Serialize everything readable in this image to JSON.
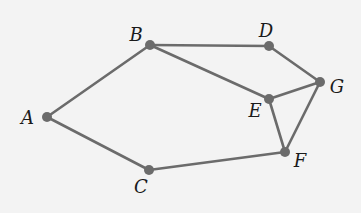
{
  "diagram": {
    "type": "graph",
    "background": "#f3f3f3",
    "edge_color": "#6b6b6b",
    "node_color": "#6b6b6b",
    "nodes": [
      {
        "id": "A",
        "label": "A",
        "x": 47,
        "y": 117,
        "lx": 34,
        "ly": 124,
        "anchor": "end"
      },
      {
        "id": "B",
        "label": "B",
        "x": 150,
        "y": 45,
        "lx": 136,
        "ly": 41,
        "anchor": "middle"
      },
      {
        "id": "C",
        "label": "C",
        "x": 149,
        "y": 170,
        "lx": 141,
        "ly": 193,
        "anchor": "middle"
      },
      {
        "id": "D",
        "label": "D",
        "x": 269,
        "y": 46,
        "lx": 266,
        "ly": 37,
        "anchor": "middle"
      },
      {
        "id": "E",
        "label": "E",
        "x": 269,
        "y": 99,
        "lx": 255,
        "ly": 117,
        "anchor": "middle"
      },
      {
        "id": "F",
        "label": "F",
        "x": 285,
        "y": 152,
        "lx": 300,
        "ly": 167,
        "anchor": "middle"
      },
      {
        "id": "G",
        "label": "G",
        "x": 320,
        "y": 82,
        "lx": 337,
        "ly": 93,
        "anchor": "middle"
      }
    ],
    "edges": [
      [
        "A",
        "B"
      ],
      [
        "A",
        "C"
      ],
      [
        "B",
        "D"
      ],
      [
        "B",
        "E"
      ],
      [
        "D",
        "G"
      ],
      [
        "E",
        "G"
      ],
      [
        "E",
        "F"
      ],
      [
        "G",
        "F"
      ],
      [
        "C",
        "F"
      ]
    ]
  }
}
